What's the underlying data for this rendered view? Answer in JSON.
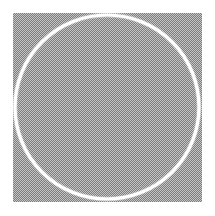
{
  "image": {
    "kind": "dithered-bitmap-graphic",
    "width": 215,
    "height": 216,
    "background_color": "#ffffff",
    "alt_text": "A square panel of gray checkerboard dither with a white circle outline drawn on it",
    "caption": ""
  },
  "panel": {
    "name": "dither-panel",
    "x": 13,
    "y": 13,
    "width": 189,
    "height": 189,
    "pattern": "checkerboard-dither-1px",
    "light_color": "#c4c4c4",
    "dark_color": "#7e7e7e",
    "perceived_color": "#a1a1a1"
  },
  "shapes": [
    {
      "name": "circle-outline",
      "type": "circle",
      "center_x": 107,
      "center_y": 107,
      "radius": 92,
      "stroke_color": "#ffffff",
      "stroke_width": 3,
      "fill": "none",
      "edge_quality": "dithered-jagged"
    }
  ],
  "margins": {
    "left": 13,
    "top": 13,
    "right": 13,
    "bottom": 14
  },
  "text_content": []
}
